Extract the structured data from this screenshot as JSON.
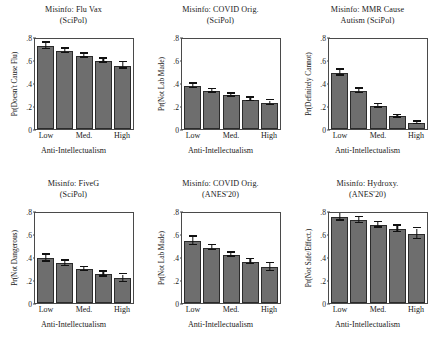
{
  "figure": {
    "shared_xlabel": "Anti-Intellectualism",
    "x_tick_labels": [
      "Low",
      "Med.",
      "High"
    ],
    "y_tick_labels": [
      "0",
      ".2",
      ".4",
      ".6",
      ".8"
    ],
    "bar_color": "#6e6e6e",
    "bar_edge_color": "#2b2b2b",
    "error_bar_color": "#111111",
    "axis_color": "#4a4a4a",
    "background": "#ffffff"
  },
  "chart_data": [
    {
      "type": "bar",
      "panel_index": 1,
      "title": "Misinfo: Flu Vax",
      "title_lines": [
        "Misinfo: Flu Vax",
        "(SciPol)"
      ],
      "subtitle": "(SciPol)",
      "dataset": "SciPol",
      "xlabel": "Anti-Intellectualism",
      "ylabel": "Pr(Doesn't Cause Flu)",
      "categories": [
        "Low",
        "",
        "Med.",
        "",
        "High"
      ],
      "values": [
        0.72,
        0.68,
        0.635,
        0.59,
        0.55
      ],
      "err_low": [
        0.695,
        0.66,
        0.62,
        0.575,
        0.525
      ],
      "err_high": [
        0.75,
        0.7,
        0.655,
        0.61,
        0.58
      ],
      "ylim": [
        0,
        0.8
      ],
      "yticks": [
        0,
        0.2,
        0.4,
        0.6,
        0.8
      ],
      "grid": false,
      "legend": "none"
    },
    {
      "type": "bar",
      "panel_index": 2,
      "title": "Misinfo: COVID Orig.",
      "title_lines": [
        "Misinfo: COVID Orig.",
        "(SciPol)"
      ],
      "subtitle": "(SciPol)",
      "dataset": "SciPol",
      "xlabel": "Anti-Intellectualism",
      "ylabel": "Pr(Not Lab Made)",
      "categories": [
        "Low",
        "",
        "Med.",
        "",
        "High"
      ],
      "values": [
        0.375,
        0.33,
        0.295,
        0.255,
        0.225
      ],
      "err_low": [
        0.355,
        0.315,
        0.282,
        0.24,
        0.205
      ],
      "err_high": [
        0.395,
        0.345,
        0.308,
        0.272,
        0.248
      ],
      "ylim": [
        0,
        0.8
      ],
      "yticks": [
        0,
        0.2,
        0.4,
        0.6,
        0.8
      ],
      "grid": false,
      "legend": "none"
    },
    {
      "type": "bar",
      "panel_index": 3,
      "title": "Misinfo: MMR Cause",
      "title_lines": [
        "Misinfo: MMR Cause",
        "Autism (SciPol)"
      ],
      "subtitle": "Autism (SciPol)",
      "dataset": "SciPol",
      "xlabel": "Anti-Intellectualism",
      "ylabel": "Pr(Definitely Cannot)",
      "categories": [
        "Low",
        "",
        "Med.",
        "",
        "High"
      ],
      "values": [
        0.49,
        0.33,
        0.2,
        0.11,
        0.05
      ],
      "err_low": [
        0.465,
        0.312,
        0.186,
        0.098,
        0.04
      ],
      "err_high": [
        0.515,
        0.35,
        0.215,
        0.122,
        0.062
      ],
      "ylim": [
        0,
        0.8
      ],
      "yticks": [
        0,
        0.2,
        0.4,
        0.6,
        0.8
      ],
      "grid": false,
      "legend": "none"
    },
    {
      "type": "bar",
      "panel_index": 4,
      "title": "Misinfo: FiveG",
      "title_lines": [
        "Misinfo: FiveG",
        "(SciPol)"
      ],
      "subtitle": "(SciPol)",
      "dataset": "SciPol",
      "xlabel": "Anti-Intellectualism",
      "ylabel": "Pr(Not Dangerous)",
      "categories": [
        "Low",
        "",
        "Med.",
        "",
        "High"
      ],
      "values": [
        0.39,
        0.345,
        0.295,
        0.25,
        0.215
      ],
      "err_low": [
        0.36,
        0.322,
        0.278,
        0.228,
        0.182
      ],
      "err_high": [
        0.42,
        0.368,
        0.312,
        0.272,
        0.248
      ],
      "ylim": [
        0,
        0.8
      ],
      "yticks": [
        0,
        0.2,
        0.4,
        0.6,
        0.8
      ],
      "grid": false,
      "legend": "none"
    },
    {
      "type": "bar",
      "panel_index": 5,
      "title": "Misinfo: COVID Orig.",
      "title_lines": [
        "Misinfo: COVID Orig.",
        "(ANES'20)"
      ],
      "subtitle": "(ANES'20)",
      "dataset": "ANES'20",
      "xlabel": "Anti-Intellectualism",
      "ylabel": "Pr(Not Lab Made)",
      "categories": [
        "Low",
        "",
        "Med.",
        "",
        "High"
      ],
      "values": [
        0.54,
        0.48,
        0.42,
        0.36,
        0.31
      ],
      "err_low": [
        0.505,
        0.458,
        0.402,
        0.338,
        0.275
      ],
      "err_high": [
        0.578,
        0.502,
        0.438,
        0.382,
        0.345
      ],
      "ylim": [
        0,
        0.8
      ],
      "yticks": [
        0,
        0.2,
        0.4,
        0.6,
        0.8
      ],
      "grid": false,
      "legend": "none"
    },
    {
      "type": "bar",
      "panel_index": 6,
      "title": "Misinfo: Hydroxy.",
      "title_lines": [
        "Misinfo: Hydroxy.",
        "(ANES'20)"
      ],
      "subtitle": "(ANES'20)",
      "dataset": "ANES'20",
      "xlabel": "Anti-Intellectualism",
      "ylabel": "Pr(Not Safe/Effect.)",
      "categories": [
        "Low",
        "",
        "Med.",
        "",
        "High"
      ],
      "values": [
        0.75,
        0.72,
        0.68,
        0.645,
        0.6
      ],
      "err_low": [
        0.715,
        0.695,
        0.655,
        0.618,
        0.555
      ],
      "err_high": [
        0.785,
        0.745,
        0.705,
        0.672,
        0.648
      ],
      "ylim": [
        0,
        0.8
      ],
      "yticks": [
        0,
        0.2,
        0.4,
        0.6,
        0.8
      ],
      "grid": false,
      "legend": "none"
    }
  ]
}
